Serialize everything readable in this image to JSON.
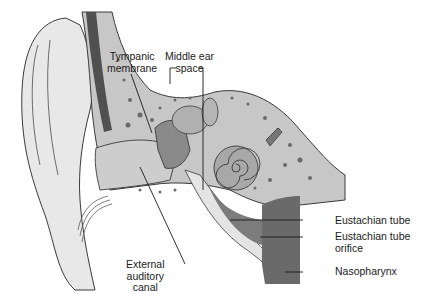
{
  "diagram": {
    "labels": {
      "tympanic_membrane": [
        "Tympanic",
        "membrane"
      ],
      "middle_ear_space": [
        "Middle ear",
        "space"
      ],
      "external_auditory_canal": [
        "External",
        "auditory",
        "canal"
      ],
      "eustachian_tube": "Eustachian tube",
      "eustachian_tube_orifice": [
        "Eustachian tube",
        "orifice"
      ],
      "nasopharynx": "Nasopharynx"
    },
    "colors": {
      "outline": "#3a3a3a",
      "skin": "#e6e6e6",
      "bone": "#bdbdbd",
      "canal": "#cfcfcf",
      "dark_tissue": "#555555",
      "tube": "#8a8a8a",
      "nasopharynx": "#6e6e6e"
    }
  }
}
